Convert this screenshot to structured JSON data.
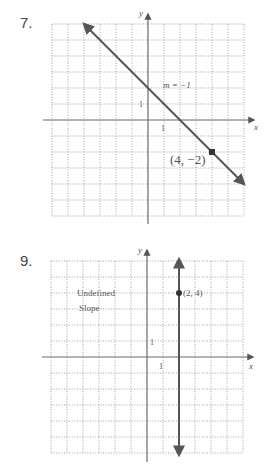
{
  "problems": [
    {
      "number": "7.",
      "annotation_slope": "m = −1",
      "point_label": "(4, −2)",
      "tick_x": "1",
      "tick_y": "1",
      "axis_x": "x",
      "axis_y": "y"
    },
    {
      "number": "9.",
      "annotation_line1": "Undefined",
      "annotation_line2": "Slope",
      "point_label": "(2, 4)",
      "tick_x": "1",
      "tick_y": "1",
      "axis_x": "x",
      "axis_y": "y"
    }
  ],
  "chart_data": [
    {
      "type": "line",
      "title": "7.",
      "xlabel": "x",
      "ylabel": "y",
      "xlim": [
        -6,
        6
      ],
      "ylim": [
        -6,
        6
      ],
      "grid": true,
      "series": [
        {
          "name": "y = -x + 2",
          "x": [
            -4,
            8
          ],
          "y": [
            6,
            -6
          ],
          "slope": -1,
          "y_intercept": 2
        }
      ],
      "points": [
        {
          "x": 4,
          "y": -2,
          "label": "(4, −2)"
        }
      ],
      "annotations": [
        "m = −1"
      ],
      "tick_labels": {
        "x": [
          "1"
        ],
        "y": [
          "1"
        ]
      }
    },
    {
      "type": "line",
      "title": "9.",
      "xlabel": "x",
      "ylabel": "y",
      "xlim": [
        -6,
        6
      ],
      "ylim": [
        -6,
        6
      ],
      "grid": true,
      "series": [
        {
          "name": "x = 2",
          "x": [
            2,
            2
          ],
          "y": [
            6,
            -6
          ],
          "slope": "undefined"
        }
      ],
      "points": [
        {
          "x": 2,
          "y": 4,
          "label": "(2, 4)"
        }
      ],
      "annotations": [
        "Undefined",
        "Slope"
      ],
      "tick_labels": {
        "x": [
          "1"
        ],
        "y": [
          "1"
        ]
      }
    }
  ]
}
